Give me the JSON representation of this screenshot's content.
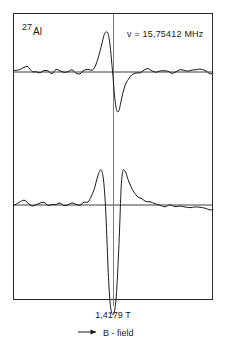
{
  "figure": {
    "name": "al27-nmr-derivative-spectrum",
    "isotope_mass": "27",
    "isotope_symbol": "Al",
    "frequency_label": "ν = 15,75412 MHz",
    "field_value_label": "1,4179 T",
    "axis_label": "B - field",
    "arrow_icon": "right-arrow-icon",
    "line_color": "#1a1a1a",
    "frame_color": "#2b2b2b",
    "background_color": "#ffffff"
  },
  "chart_data": {
    "type": "line",
    "title": "",
    "subtitle": "",
    "xlabel": "B - field",
    "ylabel": "",
    "grid": false,
    "legend": null,
    "annotations": [
      {
        "text": "27Al",
        "x": 0.07,
        "y": 0.95,
        "role": "isotope-label"
      },
      {
        "text": "ν = 15,75412 MHz",
        "x": 0.62,
        "y": 0.9,
        "role": "frequency-label"
      },
      {
        "text": "1,4179 T",
        "x": 0.5,
        "y": -0.06,
        "role": "field-tick-label"
      }
    ],
    "axis_ranges": {
      "x": [
        0,
        200
      ],
      "y_top": [
        -1.05,
        1.05
      ],
      "y_bottom": [
        -1.05,
        1.05
      ]
    },
    "center_marker_x": 113,
    "panels": [
      {
        "name": "upper-trace",
        "description": "first-derivative absorption lineshape, positive lobe then negative lobe",
        "baseline_y": 72,
        "x": [
          14,
          19,
          24,
          28,
          32,
          36,
          40,
          44,
          48,
          52,
          56,
          60,
          64,
          68,
          72,
          76,
          80,
          84,
          88,
          92,
          95,
          98,
          100,
          102,
          104,
          105,
          106,
          107,
          108,
          109,
          110,
          111,
          112,
          113,
          114,
          115,
          116,
          117,
          118,
          119,
          120,
          122,
          124,
          126,
          129,
          132,
          136,
          140,
          144,
          148,
          152,
          156,
          160,
          164,
          168,
          172,
          176,
          180,
          184,
          188,
          192,
          196,
          200,
          205,
          210,
          213
        ],
        "y": [
          0.02,
          0.05,
          0.12,
          0.1,
          0.02,
          -0.03,
          0.01,
          0.04,
          0.0,
          -0.02,
          0.03,
          0.01,
          -0.01,
          0.02,
          0.04,
          0.0,
          -0.02,
          0.01,
          0.03,
          0.06,
          0.14,
          0.34,
          0.52,
          0.72,
          0.92,
          0.98,
          1.0,
          1.0,
          0.96,
          0.86,
          0.68,
          0.44,
          0.16,
          -0.14,
          -0.44,
          -0.7,
          -0.88,
          -0.98,
          -1.0,
          -0.96,
          -0.86,
          -0.62,
          -0.42,
          -0.28,
          -0.16,
          -0.1,
          -0.06,
          -0.02,
          0.02,
          0.05,
          0.03,
          0.0,
          0.04,
          0.06,
          0.02,
          -0.01,
          0.03,
          0.07,
          0.04,
          0.01,
          0.05,
          0.08,
          0.04,
          0.01,
          -0.02,
          -0.03
        ]
      },
      {
        "name": "lower-trace",
        "description": "derivative lineshape with two outer shoulder peaks and deep central negative excursion",
        "baseline_y": 205,
        "x": [
          14,
          19,
          24,
          28,
          32,
          36,
          40,
          44,
          48,
          52,
          56,
          60,
          64,
          68,
          72,
          76,
          80,
          84,
          88,
          91,
          94,
          96,
          98,
          100,
          101,
          102,
          103,
          104,
          105,
          106,
          107,
          108,
          109,
          110,
          111,
          112,
          113,
          114,
          115,
          116,
          117,
          118,
          119,
          120,
          121,
          122,
          123,
          124,
          126,
          128,
          131,
          134,
          138,
          142,
          146,
          150,
          155,
          160,
          165,
          170,
          175,
          180,
          185,
          190,
          195,
          200,
          205,
          210,
          213
        ],
        "y": [
          0.01,
          0.04,
          0.09,
          0.06,
          0.01,
          -0.02,
          0.02,
          0.05,
          0.01,
          -0.01,
          0.03,
          0.02,
          0.0,
          0.03,
          0.05,
          0.02,
          0.01,
          0.04,
          0.1,
          0.2,
          0.38,
          0.56,
          0.74,
          0.86,
          0.88,
          0.84,
          0.72,
          0.5,
          0.18,
          -0.3,
          -0.9,
          -1.55,
          -2.05,
          -2.42,
          -2.62,
          -2.72,
          -2.74,
          -2.7,
          -2.58,
          -2.36,
          -2.0,
          -1.52,
          -0.96,
          -0.32,
          0.36,
          0.72,
          0.86,
          0.88,
          0.8,
          0.64,
          0.46,
          0.32,
          0.2,
          0.13,
          0.08,
          0.05,
          0.02,
          0.0,
          -0.02,
          -0.03,
          -0.04,
          -0.05,
          -0.06,
          -0.07,
          -0.08,
          -0.09,
          -0.1,
          -0.11,
          -0.12
        ]
      }
    ]
  }
}
